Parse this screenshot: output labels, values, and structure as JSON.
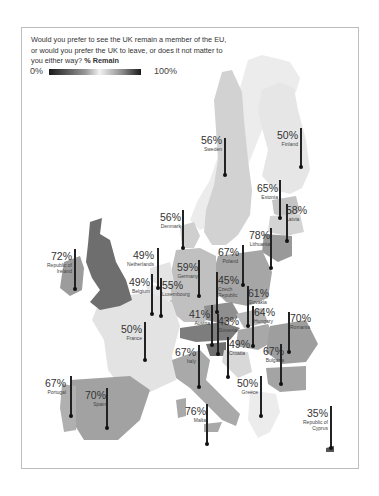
{
  "question": "Would you prefer to see the UK remain a member of the EU, or would you prefer the UK to leave, or does it not matter to you either way?",
  "metric_label": "% Remain",
  "legend": {
    "min_label": "0%",
    "max_label": "100%"
  },
  "countries": [
    {
      "name": "Sweden",
      "value": "56%"
    },
    {
      "name": "Finland",
      "value": "50%"
    },
    {
      "name": "Estonia",
      "value": "65%"
    },
    {
      "name": "Latvia",
      "value": "58%"
    },
    {
      "name": "Lithuania",
      "value": "78%"
    },
    {
      "name": "Denmark",
      "value": "56%"
    },
    {
      "name": "Republic of Ireland",
      "value": "72%"
    },
    {
      "name": "Netherlands",
      "value": "49%"
    },
    {
      "name": "Germany",
      "value": "59%"
    },
    {
      "name": "Poland",
      "value": "67%"
    },
    {
      "name": "Belgium",
      "value": "49%"
    },
    {
      "name": "Luxembourg",
      "value": "55%"
    },
    {
      "name": "Czech Republic",
      "value": "45%"
    },
    {
      "name": "Slovakia",
      "value": "61%"
    },
    {
      "name": "Austria",
      "value": "41%"
    },
    {
      "name": "Slovenia",
      "value": "43%"
    },
    {
      "name": "Hungary",
      "value": "64%"
    },
    {
      "name": "Romania",
      "value": "70%"
    },
    {
      "name": "France",
      "value": "50%"
    },
    {
      "name": "Croatia",
      "value": "49%"
    },
    {
      "name": "Italy",
      "value": "67%"
    },
    {
      "name": "Bulgaria",
      "value": "67%"
    },
    {
      "name": "Portugal",
      "value": "67%"
    },
    {
      "name": "Spain",
      "value": "70%"
    },
    {
      "name": "Malta",
      "value": "76%"
    },
    {
      "name": "Greece",
      "value": "50%"
    },
    {
      "name": "Republic of Cyprus",
      "value": "35%"
    }
  ],
  "labels": {
    "sweden": {
      "pct": "56%",
      "name": "Sweden"
    },
    "finland": {
      "pct": "50%",
      "name": "Finland"
    },
    "estonia": {
      "pct": "65%",
      "name": "Estonia"
    },
    "latvia": {
      "pct": "58%",
      "name": "Latvia"
    },
    "lithuania": {
      "pct": "78%",
      "name": "Lithuania"
    },
    "denmark": {
      "pct": "56%",
      "name": "Denmark"
    },
    "ireland": {
      "pct": "72%",
      "name1": "Republic of",
      "name2": "Ireland"
    },
    "netherlands": {
      "pct": "49%",
      "name": "Netherlands"
    },
    "germany": {
      "pct": "59%",
      "name": "Germany"
    },
    "poland": {
      "pct": "67%",
      "name": "Poland"
    },
    "belgium": {
      "pct": "49%",
      "name": "Belgium"
    },
    "luxembourg": {
      "pct": "55%",
      "name": "Luxembourg"
    },
    "czech": {
      "pct": "45%",
      "name1": "Czech",
      "name2": "Republic"
    },
    "slovakia": {
      "pct": "61%",
      "name": "Slovakia"
    },
    "austria": {
      "pct": "41%",
      "name": "Austria"
    },
    "slovenia": {
      "pct": "43%",
      "name": "Slovenia"
    },
    "hungary": {
      "pct": "64%",
      "name": "Hungary"
    },
    "romania": {
      "pct": "70%",
      "name": "Romania"
    },
    "france": {
      "pct": "50%",
      "name": "France"
    },
    "croatia": {
      "pct": "49%",
      "name": "Croatia"
    },
    "italy": {
      "pct": "67%",
      "name": "Italy"
    },
    "bulgaria": {
      "pct": "67%",
      "name": "Bulgaria"
    },
    "portugal": {
      "pct": "67%",
      "name": "Portugal"
    },
    "spain": {
      "pct": "70%",
      "name": "Spain"
    },
    "malta": {
      "pct": "76%",
      "name": "Malta"
    },
    "greece": {
      "pct": "50%",
      "name": "Greece"
    },
    "cyprus": {
      "pct": "35%",
      "name1": "Republic of",
      "name2": "Cyprus"
    }
  },
  "colors": {
    "uk": "#6e6e6e",
    "frame": "#bdbdbd",
    "pin": "#222222"
  }
}
